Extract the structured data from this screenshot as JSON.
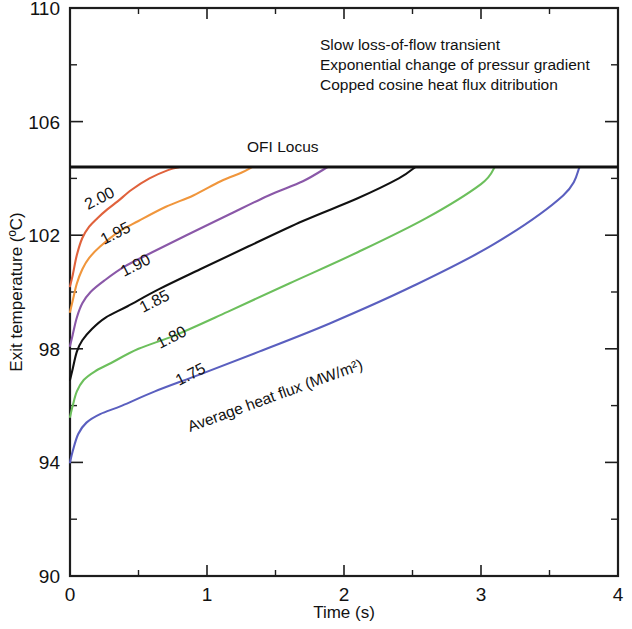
{
  "chart_data": {
    "type": "line",
    "title": "",
    "xlabel": "Time (s)",
    "ylabel": "Exit temperature (ºC)",
    "xlim": [
      0,
      4
    ],
    "ylim": [
      90,
      110
    ],
    "xticks": [
      "0",
      "1",
      "2",
      "3",
      "4"
    ],
    "xtick_values": [
      0,
      1,
      2,
      3,
      4
    ],
    "xminor_values": [
      0.5,
      1.5,
      2.5,
      3.5
    ],
    "yticks": [
      "90",
      "94",
      "98",
      "102",
      "106",
      "110"
    ],
    "ytick_values": [
      90,
      94,
      98,
      102,
      106,
      110
    ],
    "yminor_values": [
      92,
      96,
      100,
      104,
      108
    ],
    "grid": false,
    "legend_position": "inline-curve-labels",
    "annotations": [
      "Slow loss-of-flow transient",
      "Exponential change of pressur gradient",
      "Copped cosine heat flux ditribution"
    ],
    "ofi_locus": {
      "label": "OFI Locus",
      "y_value": 104.4,
      "color": "#111111",
      "x_from": 0,
      "x_to": 4
    },
    "series_group_label": "Average heat flux (MW/m²)",
    "series": [
      {
        "name": "2.00",
        "label": "2.00",
        "color": "#e0623c",
        "x": [
          0.0,
          0.02,
          0.05,
          0.09,
          0.14,
          0.2,
          0.27,
          0.35,
          0.45,
          0.58,
          0.72,
          0.8
        ],
        "values": [
          100.2,
          100.6,
          101.3,
          101.9,
          102.3,
          102.6,
          102.9,
          103.2,
          103.6,
          104.0,
          104.3,
          104.4
        ]
      },
      {
        "name": "1.95",
        "label": "1.95",
        "color": "#f0963c",
        "x": [
          0.0,
          0.02,
          0.05,
          0.09,
          0.14,
          0.22,
          0.35,
          0.5,
          0.7,
          0.9,
          1.1,
          1.25,
          1.33
        ],
        "values": [
          99.3,
          99.7,
          100.3,
          100.8,
          101.2,
          101.6,
          102.1,
          102.5,
          103.0,
          103.4,
          103.9,
          104.2,
          104.4
        ]
      },
      {
        "name": "1.90",
        "label": "1.90",
        "color": "#8a58a8",
        "x": [
          0.0,
          0.02,
          0.05,
          0.09,
          0.15,
          0.25,
          0.4,
          0.6,
          0.85,
          1.15,
          1.45,
          1.7,
          1.88
        ],
        "values": [
          98.1,
          98.5,
          99.1,
          99.6,
          100.0,
          100.4,
          100.9,
          101.4,
          102.0,
          102.7,
          103.4,
          103.9,
          104.4
        ]
      },
      {
        "name": "1.85",
        "label": "1.85",
        "color": "#111111",
        "x": [
          0.0,
          0.02,
          0.05,
          0.09,
          0.16,
          0.26,
          0.42,
          0.65,
          0.95,
          1.3,
          1.7,
          2.1,
          2.4,
          2.52
        ],
        "values": [
          96.9,
          97.3,
          97.9,
          98.3,
          98.7,
          99.1,
          99.5,
          100.1,
          100.8,
          101.6,
          102.5,
          103.3,
          104.0,
          104.4
        ]
      },
      {
        "name": "1.80",
        "label": "1.80",
        "color": "#6cbf5c",
        "x": [
          0.0,
          0.02,
          0.05,
          0.1,
          0.18,
          0.3,
          0.5,
          0.78,
          1.15,
          1.6,
          2.1,
          2.6,
          3.0,
          3.1
        ],
        "values": [
          95.6,
          96.0,
          96.5,
          96.9,
          97.2,
          97.5,
          98.0,
          98.5,
          99.3,
          100.3,
          101.4,
          102.6,
          103.8,
          104.4
        ]
      },
      {
        "name": "1.75",
        "label": "1.75",
        "color": "#5a5fbf",
        "x": [
          0.0,
          0.02,
          0.06,
          0.12,
          0.22,
          0.38,
          0.62,
          0.95,
          1.38,
          1.9,
          2.5,
          3.1,
          3.6,
          3.72
        ],
        "values": [
          94.0,
          94.4,
          95.0,
          95.4,
          95.7,
          96.0,
          96.5,
          97.1,
          97.9,
          98.9,
          100.2,
          101.7,
          103.4,
          104.4
        ]
      }
    ]
  }
}
